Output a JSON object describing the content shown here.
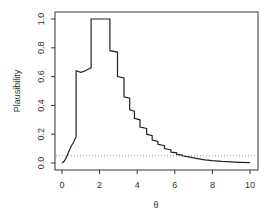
{
  "chart_data": {
    "type": "line",
    "title": "",
    "xlabel": "θ",
    "ylabel": "Plausibility",
    "xlim": [
      0,
      10
    ],
    "ylim": [
      0,
      1
    ],
    "xticks": [
      0,
      2,
      4,
      6,
      8,
      10
    ],
    "yticks": [
      0.0,
      0.2,
      0.4,
      0.6,
      0.8,
      1.0
    ],
    "xtick_labels": [
      "0",
      "2",
      "4",
      "6",
      "8",
      "10"
    ],
    "ytick_labels": [
      "0.0",
      "0.2",
      "0.4",
      "0.6",
      "0.8",
      "1.0"
    ],
    "grid": false,
    "legend": null,
    "reference_line": {
      "y": 0.05,
      "style": "dotted",
      "color": "#999999"
    },
    "series": [
      {
        "name": "plausibility",
        "color": "#222222",
        "step": true,
        "x": [
          0.0,
          0.1,
          0.2,
          0.3,
          0.4,
          0.5,
          0.6,
          0.7,
          0.75,
          0.75,
          1.0,
          1.25,
          1.5,
          1.55,
          1.55,
          2.55,
          2.55,
          2.95,
          2.95,
          3.3,
          3.3,
          3.6,
          3.6,
          3.85,
          3.85,
          4.15,
          4.15,
          4.5,
          4.5,
          4.8,
          4.8,
          5.1,
          5.1,
          5.45,
          5.45,
          5.8,
          5.8,
          6.1,
          6.1,
          6.4,
          6.4,
          6.8,
          7.2,
          7.6,
          8.0,
          8.5,
          9.0,
          9.5,
          10.0
        ],
        "y": [
          0.0,
          0.01,
          0.03,
          0.06,
          0.09,
          0.12,
          0.14,
          0.17,
          0.18,
          0.64,
          0.63,
          0.64,
          0.66,
          0.66,
          1.0,
          1.0,
          0.78,
          0.77,
          0.6,
          0.59,
          0.46,
          0.45,
          0.37,
          0.36,
          0.31,
          0.3,
          0.25,
          0.24,
          0.2,
          0.19,
          0.16,
          0.15,
          0.13,
          0.12,
          0.1,
          0.09,
          0.075,
          0.07,
          0.06,
          0.055,
          0.05,
          0.04,
          0.03,
          0.022,
          0.016,
          0.011,
          0.008,
          0.005,
          0.003
        ]
      }
    ]
  }
}
